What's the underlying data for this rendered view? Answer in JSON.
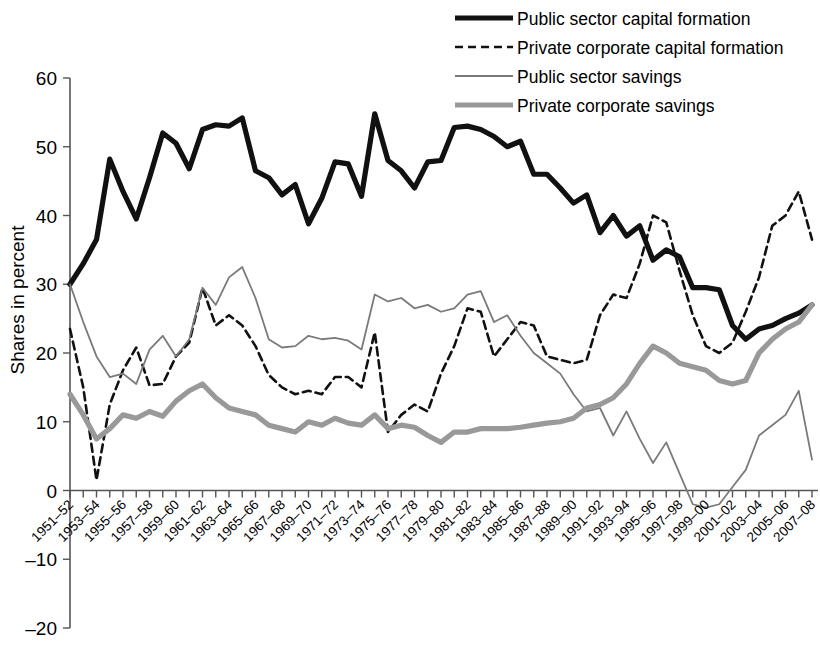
{
  "chart_data": {
    "type": "line",
    "title": "",
    "xlabel": "",
    "ylabel": "Shares in percent",
    "ylim": [
      -20,
      60
    ],
    "yticks": [
      60,
      50,
      40,
      30,
      20,
      10,
      0,
      -10,
      -20
    ],
    "ytick_labels": [
      "60",
      "50",
      "40",
      "30",
      "20",
      "10",
      "0",
      "–10",
      "–20"
    ],
    "grid": false,
    "legend_position": "top-right",
    "x": [
      "1951–52",
      "1952–53",
      "1953–54",
      "1954–55",
      "1955–56",
      "1956–57",
      "1957–58",
      "1958–59",
      "1959–60",
      "1960–61",
      "1961–62",
      "1962–63",
      "1963–64",
      "1964–65",
      "1965–66",
      "1966–67",
      "1967–68",
      "1968–69",
      "1969–70",
      "1970–71",
      "1971–72",
      "1972–73",
      "1973–74",
      "1974–75",
      "1975–76",
      "1976–77",
      "1977–78",
      "1978–79",
      "1979–80",
      "1980–81",
      "1981–82",
      "1982–83",
      "1983–84",
      "1984–85",
      "1985–86",
      "1986–87",
      "1987–88",
      "1988–89",
      "1989–90",
      "1990–91",
      "1991–92",
      "1992–93",
      "1993–94",
      "1994–95",
      "1995–96",
      "1996–97",
      "1997–98",
      "1998–99",
      "1999–00",
      "2000–01",
      "2001–02",
      "2002–03",
      "2003–04",
      "2004–05",
      "2005–06",
      "2006–07",
      "2007–08"
    ],
    "xtick_labels": [
      "1951–52",
      "1953–54",
      "1955–56",
      "1957–58",
      "1959–60",
      "1961–62",
      "1963–64",
      "1965–66",
      "1967–68",
      "1969–70",
      "1971–72",
      "1973–74",
      "1975–76",
      "1977–78",
      "1979–80",
      "1981–82",
      "1983–84",
      "1985–86",
      "1987–88",
      "1989–90",
      "1991–92",
      "1993–94",
      "1995–96",
      "1997–98",
      "1999–00",
      "2001–02",
      "2003–04",
      "2005–06",
      "2007–08"
    ],
    "series": [
      {
        "name": "Public sector capital formation",
        "color": "#111111",
        "width": 5.2,
        "dash": "none",
        "values": [
          30.0,
          33.0,
          36.5,
          48.2,
          43.5,
          39.5,
          45.5,
          52.0,
          50.5,
          46.8,
          52.5,
          53.2,
          53.0,
          54.2,
          46.5,
          45.5,
          43.0,
          44.5,
          38.8,
          42.5,
          47.8,
          47.5,
          42.8,
          54.8,
          48.0,
          46.5,
          44.0,
          47.8,
          48.0,
          52.8,
          53.0,
          52.5,
          51.5,
          50.0,
          50.8,
          46.0,
          46.0,
          44.0,
          41.8,
          43.0,
          37.5,
          40.0,
          37.0,
          38.5,
          33.5,
          35.0,
          34.0,
          29.5,
          29.5,
          29.2,
          24.0,
          22.0,
          23.5,
          24.0,
          25.0,
          25.8,
          27.0
        ]
      },
      {
        "name": "Private corporate capital formation",
        "color": "#111111",
        "width": 2.6,
        "dash": "8,5",
        "values": [
          23.5,
          15.0,
          1.5,
          12.5,
          17.5,
          20.8,
          15.3,
          15.5,
          19.5,
          21.5,
          29.5,
          24.0,
          25.5,
          24.0,
          21.0,
          16.8,
          15.0,
          14.0,
          14.5,
          14.0,
          16.5,
          16.5,
          15.0,
          23.0,
          8.5,
          11.0,
          12.5,
          11.5,
          17.0,
          21.0,
          26.5,
          26.0,
          19.5,
          22.0,
          24.5,
          24.0,
          19.5,
          19.0,
          18.5,
          19.0,
          25.5,
          28.5,
          28.0,
          33.0,
          40.0,
          39.0,
          32.0,
          25.5,
          21.0,
          20.0,
          21.5,
          26.0,
          31.0,
          38.5,
          40.0,
          43.5,
          36.5
        ]
      },
      {
        "name": "Public sector savings",
        "color": "#7a7a7a",
        "width": 1.8,
        "dash": "none",
        "values": [
          30.0,
          24.5,
          19.5,
          16.5,
          17.0,
          15.5,
          20.5,
          22.5,
          19.5,
          22.0,
          29.5,
          27.0,
          31.0,
          32.5,
          28.0,
          22.0,
          20.8,
          21.0,
          22.5,
          22.0,
          22.2,
          21.8,
          20.5,
          28.5,
          27.5,
          28.0,
          26.5,
          27.0,
          26.0,
          26.5,
          28.5,
          29.0,
          24.5,
          25.5,
          22.5,
          20.0,
          18.5,
          17.0,
          14.0,
          11.5,
          12.0,
          8.0,
          11.5,
          7.5,
          4.0,
          7.0,
          2.5,
          -2.0,
          -2.5,
          -2.0,
          0.5,
          3.0,
          8.0,
          9.5,
          11.0,
          14.5,
          4.5
        ]
      },
      {
        "name": "Private corporate savings",
        "color": "#999999",
        "width": 5.2,
        "dash": "none",
        "values": [
          14.0,
          11.0,
          7.5,
          9.0,
          11.0,
          10.5,
          11.5,
          10.8,
          13.0,
          14.5,
          15.5,
          13.5,
          12.0,
          11.5,
          11.0,
          9.5,
          9.0,
          8.5,
          10.0,
          9.5,
          10.5,
          9.8,
          9.5,
          11.0,
          9.0,
          9.5,
          9.2,
          8.0,
          7.0,
          8.5,
          8.5,
          9.0,
          9.0,
          9.0,
          9.2,
          9.5,
          9.8,
          10.0,
          10.5,
          12.0,
          12.5,
          13.5,
          15.5,
          18.5,
          21.0,
          20.0,
          18.5,
          18.0,
          17.5,
          16.0,
          15.5,
          16.0,
          20.0,
          22.0,
          23.5,
          24.5,
          27.0
        ]
      }
    ]
  },
  "legend": {
    "items": [
      {
        "label": "Public sector capital formation",
        "icon": "thick-solid-line-swatch"
      },
      {
        "label": "Private corporate capital formation",
        "icon": "dashed-line-swatch"
      },
      {
        "label": "Public sector savings",
        "icon": "thin-solid-line-swatch"
      },
      {
        "label": "Private corporate savings",
        "icon": "thick-grey-line-swatch"
      }
    ]
  }
}
